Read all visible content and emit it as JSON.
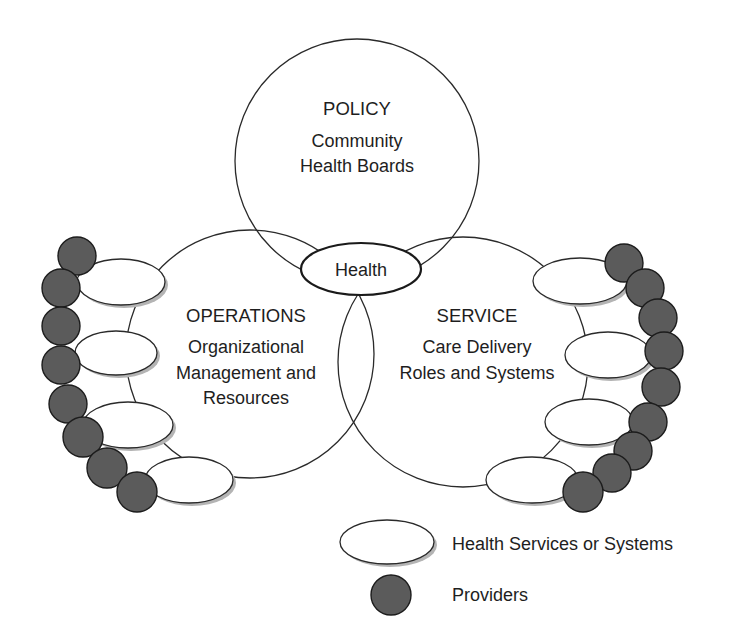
{
  "diagram": {
    "policy": {
      "title": "POLICY",
      "line1": "Community",
      "line2": "Health Boards",
      "circle": {
        "cx": 357,
        "cy": 161,
        "r": 122
      }
    },
    "operations": {
      "title": "OPERATIONS",
      "line1": "Organizational",
      "line2": "Management and",
      "line3": "Resources",
      "circle": {
        "cx": 250,
        "cy": 354,
        "r": 124
      }
    },
    "service": {
      "title": "SERVICE",
      "line1": "Care Delivery",
      "line2": "Roles and Systems",
      "circle": {
        "cx": 463,
        "cy": 362,
        "r": 125
      }
    },
    "center": {
      "label": "Health",
      "ellipse": {
        "cx": 361,
        "cy": 269,
        "rx": 60,
        "ry": 26
      }
    },
    "left_services": [
      {
        "cx": 121,
        "cy": 282,
        "rx": 44,
        "ry": 23
      },
      {
        "cx": 116,
        "cy": 353,
        "rx": 41,
        "ry": 22
      },
      {
        "cx": 128,
        "cy": 425,
        "rx": 45,
        "ry": 23
      },
      {
        "cx": 189,
        "cy": 480,
        "rx": 44,
        "ry": 23
      }
    ],
    "right_services": [
      {
        "cx": 580,
        "cy": 281,
        "rx": 47,
        "ry": 23
      },
      {
        "cx": 608,
        "cy": 355,
        "rx": 43,
        "ry": 23
      },
      {
        "cx": 589,
        "cy": 422,
        "rx": 44,
        "ry": 23
      },
      {
        "cx": 532,
        "cy": 480,
        "rx": 46,
        "ry": 23
      }
    ],
    "left_providers": [
      {
        "cx": 77,
        "cy": 256,
        "r": 19
      },
      {
        "cx": 61,
        "cy": 288,
        "r": 19
      },
      {
        "cx": 61,
        "cy": 326,
        "r": 19
      },
      {
        "cx": 61,
        "cy": 365,
        "r": 19
      },
      {
        "cx": 68,
        "cy": 404,
        "r": 19
      },
      {
        "cx": 83,
        "cy": 437,
        "r": 20
      },
      {
        "cx": 107,
        "cy": 468,
        "r": 20
      },
      {
        "cx": 137,
        "cy": 492,
        "r": 20
      }
    ],
    "right_providers": [
      {
        "cx": 624,
        "cy": 263,
        "r": 19
      },
      {
        "cx": 645,
        "cy": 288,
        "r": 19
      },
      {
        "cx": 658,
        "cy": 318,
        "r": 19
      },
      {
        "cx": 664,
        "cy": 351,
        "r": 19
      },
      {
        "cx": 661,
        "cy": 387,
        "r": 19
      },
      {
        "cx": 648,
        "cy": 422,
        "r": 19
      },
      {
        "cx": 633,
        "cy": 451,
        "r": 19
      },
      {
        "cx": 612,
        "cy": 473,
        "r": 19
      },
      {
        "cx": 583,
        "cy": 492,
        "r": 20
      }
    ]
  },
  "legend": {
    "services_label": "Health Services or Systems",
    "providers_label": "Providers",
    "services_icon": "white-ellipse",
    "providers_icon": "dark-gray-circle"
  },
  "colors": {
    "provider_fill": "#5b5b5b",
    "stroke": "#2a2a2a",
    "shadow": "#b4b4b4",
    "background": "#ffffff"
  }
}
